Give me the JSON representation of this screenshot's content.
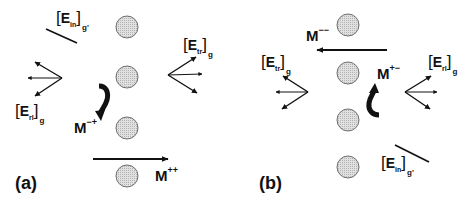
{
  "panels": [
    {
      "id": "a",
      "label": "(a)",
      "labels": {
        "incident": {
          "E": "E",
          "sub": "in",
          "g": "g'"
        },
        "transmitted": {
          "E": "E",
          "sub": "tr",
          "g": "g"
        },
        "reflected": {
          "E": "E",
          "sub": "rl",
          "g": "g"
        },
        "mode_flip": {
          "M": "M",
          "sup": "−+"
        },
        "mode_straight": {
          "M": "M",
          "sup": "++"
        }
      }
    },
    {
      "id": "b",
      "label": "(b)",
      "labels": {
        "incident": {
          "E": "E",
          "sub": "in",
          "g": "g'"
        },
        "transmitted": {
          "E": "E",
          "sub": "tr",
          "g": "g"
        },
        "reflected": {
          "E": "E",
          "sub": "rl",
          "g": "g"
        },
        "mode_straight": {
          "M": "M",
          "sup": "−−"
        },
        "mode_flip": {
          "M": "M",
          "sup": "+−"
        }
      }
    }
  ],
  "colors": {
    "circle_fill": "#d4d4d4",
    "circle_stroke": "#6e6e6e",
    "ink": "#111111"
  }
}
